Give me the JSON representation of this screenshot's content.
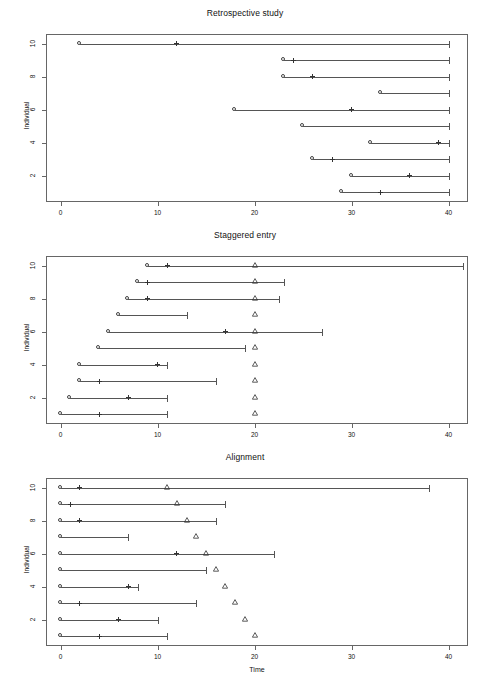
{
  "figure": {
    "xlabel": "Time",
    "ylabel": "Individual",
    "n_individuals": 10
  },
  "chart_data": [
    {
      "type": "scatter",
      "title": "Retrospective study",
      "xlabel": "",
      "ylabel": "Individual",
      "xlim": [
        -1.5,
        42
      ],
      "ylim": [
        0.4,
        10.6
      ],
      "xticks": [
        0,
        10,
        20,
        30,
        40
      ],
      "yticks": [
        2,
        4,
        6,
        8,
        10
      ],
      "grid": false,
      "legend": "none",
      "marker_legend": {
        "circle": "entry / start of observation",
        "cross": "event",
        "cap": "end of follow-up"
      },
      "individuals": [
        {
          "id": 10,
          "start": 2,
          "event": 12,
          "end": 40
        },
        {
          "id": 9,
          "start": 23,
          "event": 24,
          "end": 40
        },
        {
          "id": 8,
          "start": 23,
          "event": 26,
          "end": 40
        },
        {
          "id": 7,
          "start": 33,
          "event": null,
          "end": 40
        },
        {
          "id": 6,
          "start": 18,
          "event": 30,
          "end": 40
        },
        {
          "id": 5,
          "start": 25,
          "event": null,
          "end": 40
        },
        {
          "id": 4,
          "start": 32,
          "event": 39,
          "end": 40
        },
        {
          "id": 3,
          "start": 26,
          "event": 28,
          "end": 40
        },
        {
          "id": 2,
          "start": 30,
          "event": 36,
          "end": 40
        },
        {
          "id": 1,
          "start": 29,
          "event": 33,
          "end": 40
        }
      ]
    },
    {
      "type": "scatter",
      "title": "Staggered entry",
      "xlabel": "",
      "ylabel": "Individual",
      "xlim": [
        -1.5,
        42
      ],
      "ylim": [
        0.4,
        10.6
      ],
      "xticks": [
        0,
        10,
        20,
        30,
        40
      ],
      "yticks": [
        2,
        4,
        6,
        8,
        10
      ],
      "grid": false,
      "legend": "none",
      "marker_legend": {
        "circle": "entry",
        "cross": "event",
        "triangle": "end of study (t = 20)",
        "cap": "end of follow-up"
      },
      "individuals": [
        {
          "id": 10,
          "start": 9,
          "event": 11,
          "triangle": 20,
          "end": 41.5
        },
        {
          "id": 9,
          "start": 8,
          "event": 9,
          "triangle": 20,
          "end": 23
        },
        {
          "id": 8,
          "start": 7,
          "event": 9,
          "triangle": 20,
          "end": 22.5
        },
        {
          "id": 7,
          "start": 6,
          "event": null,
          "triangle": 20,
          "end": 13
        },
        {
          "id": 6,
          "start": 5,
          "event": 17,
          "triangle": 20,
          "end": 27
        },
        {
          "id": 5,
          "start": 4,
          "event": null,
          "triangle": 20,
          "end": 19
        },
        {
          "id": 4,
          "start": 2,
          "event": 10,
          "triangle": 20,
          "end": 11
        },
        {
          "id": 3,
          "start": 2,
          "event": 4,
          "triangle": 20,
          "end": 16
        },
        {
          "id": 2,
          "start": 1,
          "event": 7,
          "triangle": 20,
          "end": 11
        },
        {
          "id": 1,
          "start": 0,
          "event": 4,
          "triangle": 20,
          "end": 11
        }
      ]
    },
    {
      "type": "scatter",
      "title": "Alignment",
      "xlabel": "Time",
      "ylabel": "Individual",
      "xlim": [
        -1.5,
        42
      ],
      "ylim": [
        0.4,
        10.6
      ],
      "xticks": [
        0,
        10,
        20,
        30,
        40
      ],
      "yticks": [
        2,
        4,
        6,
        8,
        10
      ],
      "grid": false,
      "legend": "none",
      "marker_legend": {
        "circle": "time zero (t = 0)",
        "cross": "event",
        "triangle": "administrative censoring",
        "cap": "end of follow-up"
      },
      "individuals": [
        {
          "id": 10,
          "start": 0,
          "event": 2,
          "triangle": 11,
          "end": 38
        },
        {
          "id": 9,
          "start": 0,
          "event": 1,
          "triangle": 12,
          "end": 17
        },
        {
          "id": 8,
          "start": 0,
          "event": 2,
          "triangle": 13,
          "end": 16
        },
        {
          "id": 7,
          "start": 0,
          "event": null,
          "triangle": 14,
          "end": 7
        },
        {
          "id": 6,
          "start": 0,
          "event": 12,
          "triangle": 15,
          "end": 22
        },
        {
          "id": 5,
          "start": 0,
          "event": null,
          "triangle": 16,
          "end": 15
        },
        {
          "id": 4,
          "start": 0,
          "event": 7,
          "triangle": 17,
          "end": 8
        },
        {
          "id": 3,
          "start": 0,
          "event": 2,
          "triangle": 18,
          "end": 14
        },
        {
          "id": 2,
          "start": 0,
          "event": 6,
          "triangle": 19,
          "end": 10
        },
        {
          "id": 1,
          "start": 0,
          "event": 4,
          "triangle": 20,
          "end": 11
        }
      ]
    }
  ]
}
